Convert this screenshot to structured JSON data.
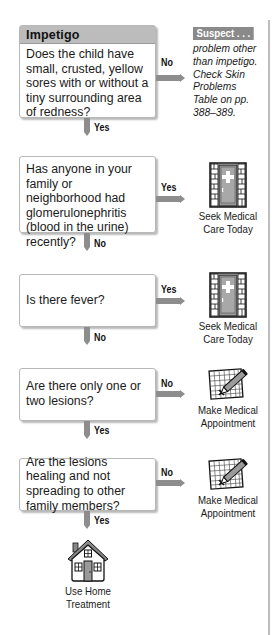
{
  "title": "Impetigo",
  "colors": {
    "arrow": "#8d8d8d",
    "header_bg": "#bcbcbc",
    "suspect_tag_bg": "#8a8a8a",
    "rule": "#bdbdbd"
  },
  "questions": [
    {
      "text": "Does the child have small, crusted, yellow sores with or without a tiny surrounding area of redness?",
      "side_label": "No",
      "down_label": "Yes"
    },
    {
      "text": "Has anyone in your family or neighborhood had glomerulonephritis (blood in the urine) recently?",
      "side_label": "Yes",
      "down_label": "No"
    },
    {
      "text": "Is there fever?",
      "side_label": "Yes",
      "down_label": "No"
    },
    {
      "text": "Are there only one or two lesions?",
      "side_label": "No",
      "down_label": "Yes"
    },
    {
      "text": "Are the lesions healing and not spreading to other family members?",
      "side_label": "No",
      "down_label": "Yes"
    }
  ],
  "suspect": {
    "tag": "Suspect . . .",
    "text": "problem other than impetigo. Check Skin Problems Table on pp. 388–389."
  },
  "outcomes": [
    {
      "icon": "hospital-door-icon",
      "line1": "Seek Medical",
      "line2": "Care Today"
    },
    {
      "icon": "hospital-door-icon",
      "line1": "Seek Medical",
      "line2": "Care Today"
    },
    {
      "icon": "calendar-pencil-icon",
      "line1": "Make Medical",
      "line2": "Appointment"
    },
    {
      "icon": "calendar-pencil-icon",
      "line1": "Make Medical",
      "line2": "Appointment"
    },
    {
      "icon": "home-icon",
      "line1": "Use Home",
      "line2": "Treatment"
    }
  ]
}
